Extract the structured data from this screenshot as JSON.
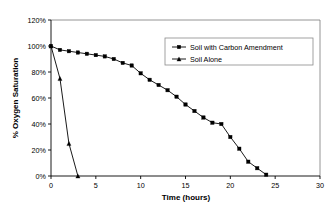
{
  "chart_data": {
    "type": "line",
    "title": "",
    "xlabel": "Time (hours)",
    "ylabel": "% Oxygen Saturation",
    "xlim": [
      0,
      30
    ],
    "ylim": [
      0,
      120
    ],
    "grid": false,
    "legend_position": "upper-right",
    "x_ticks": [
      "0",
      "5",
      "10",
      "15",
      "20",
      "25",
      "30"
    ],
    "x_tick_values": [
      0,
      5,
      10,
      15,
      20,
      25,
      30
    ],
    "y_ticks": [
      "0%",
      "20%",
      "40%",
      "60%",
      "80%",
      "100%",
      "120%"
    ],
    "y_tick_values": [
      0,
      20,
      40,
      60,
      80,
      100,
      120
    ],
    "series": [
      {
        "name": "Soil with Carbon Amendment",
        "marker": "square",
        "x": [
          0,
          1,
          2,
          3,
          4,
          5,
          6,
          7,
          8,
          9,
          10,
          11,
          12,
          13,
          14,
          15,
          16,
          17,
          18,
          19,
          20,
          21,
          22,
          23,
          24
        ],
        "values": [
          100,
          97,
          96,
          95,
          94,
          93,
          92,
          90,
          87,
          85,
          79,
          74,
          70,
          66,
          61,
          55,
          50,
          45,
          41,
          40,
          30,
          21,
          11,
          6,
          1
        ]
      },
      {
        "name": "Soil Alone",
        "marker": "triangle",
        "x": [
          0,
          1,
          2,
          3
        ],
        "values": [
          100,
          75,
          25,
          0
        ]
      }
    ]
  },
  "legend": {
    "entries": [
      {
        "label": "Soil with Carbon Amendment",
        "marker": "square"
      },
      {
        "label": "Soil Alone",
        "marker": "triangle"
      }
    ]
  }
}
